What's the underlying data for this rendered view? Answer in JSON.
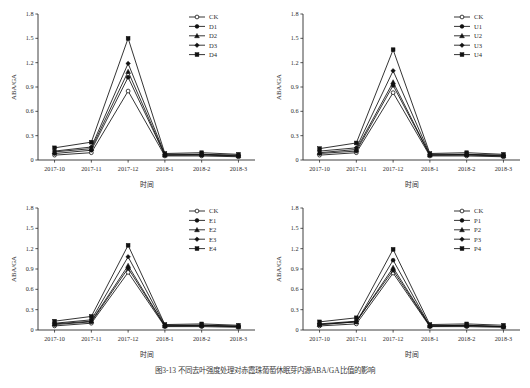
{
  "figure": {
    "caption": "图3-13  不同去叶强度处理对赤霞珠葡萄休眠芽内源ABA/GA比值的影响",
    "panel_count": 4
  },
  "axis": {
    "x_label": "时间",
    "y_label": "ABA/GA",
    "x_ticks": [
      "2017-10",
      "2017-11",
      "2017-12",
      "2018-1",
      "2018-2",
      "2018-3"
    ],
    "y_ticks": [
      "0",
      "0.3",
      "0.6",
      "0.9",
      "1.2",
      "1.5",
      "1.8"
    ]
  },
  "markers": {
    "ck": "open-circle",
    "s1": "filled-circle",
    "s2": "filled-triangle",
    "s3": "filled-diamond",
    "s4": "filled-square"
  },
  "chart_data": [
    {
      "type": "line",
      "panel": "top-left",
      "title": "",
      "xlabel": "时间",
      "ylabel": "ABA/GA",
      "categories": [
        "2017-10",
        "2017-11",
        "2017-12",
        "2018-1",
        "2018-2",
        "2018-3"
      ],
      "ylim": [
        0,
        1.8
      ],
      "xlim_labels": [
        "2017-10",
        "2018-3"
      ],
      "grid": false,
      "legend_position": "top-right",
      "series": [
        {
          "name": "CK",
          "marker": "open-circle",
          "values": [
            0.06,
            0.09,
            0.85,
            0.05,
            0.05,
            0.04
          ]
        },
        {
          "name": "D1",
          "marker": "filled-circle",
          "values": [
            0.08,
            0.12,
            1.02,
            0.06,
            0.06,
            0.05
          ]
        },
        {
          "name": "D2",
          "marker": "filled-triangle",
          "values": [
            0.1,
            0.14,
            1.09,
            0.06,
            0.07,
            0.05
          ]
        },
        {
          "name": "D3",
          "marker": "filled-diamond",
          "values": [
            0.11,
            0.16,
            1.19,
            0.07,
            0.07,
            0.06
          ]
        },
        {
          "name": "D4",
          "marker": "filled-square",
          "values": [
            0.15,
            0.22,
            1.5,
            0.08,
            0.09,
            0.07
          ]
        }
      ]
    },
    {
      "type": "line",
      "panel": "top-right",
      "title": "",
      "xlabel": "时间",
      "ylabel": "ABA/GA",
      "categories": [
        "2017-10",
        "2017-11",
        "2017-12",
        "2018-1",
        "2018-2",
        "2018-3"
      ],
      "ylim": [
        0,
        1.8
      ],
      "grid": false,
      "legend_position": "top-right",
      "series": [
        {
          "name": "CK",
          "marker": "open-circle",
          "values": [
            0.06,
            0.09,
            0.83,
            0.05,
            0.05,
            0.04
          ]
        },
        {
          "name": "U1",
          "marker": "filled-circle",
          "values": [
            0.08,
            0.11,
            0.92,
            0.06,
            0.06,
            0.05
          ]
        },
        {
          "name": "U2",
          "marker": "filled-triangle",
          "values": [
            0.09,
            0.13,
            0.96,
            0.06,
            0.07,
            0.05
          ]
        },
        {
          "name": "U3",
          "marker": "filled-diamond",
          "values": [
            0.11,
            0.15,
            1.1,
            0.07,
            0.07,
            0.06
          ]
        },
        {
          "name": "U4",
          "marker": "filled-square",
          "values": [
            0.14,
            0.21,
            1.36,
            0.08,
            0.09,
            0.07
          ]
        }
      ]
    },
    {
      "type": "line",
      "panel": "bottom-left",
      "title": "",
      "xlabel": "时间",
      "ylabel": "ABA/GA",
      "categories": [
        "2017-10",
        "2017-11",
        "2017-12",
        "2018-1",
        "2018-2",
        "2018-3"
      ],
      "ylim": [
        0,
        1.8
      ],
      "grid": false,
      "legend_position": "top-right",
      "series": [
        {
          "name": "CK",
          "marker": "open-circle",
          "values": [
            0.06,
            0.1,
            0.85,
            0.05,
            0.05,
            0.04
          ]
        },
        {
          "name": "E1",
          "marker": "filled-circle",
          "values": [
            0.08,
            0.12,
            0.91,
            0.06,
            0.06,
            0.05
          ]
        },
        {
          "name": "E2",
          "marker": "filled-triangle",
          "values": [
            0.09,
            0.13,
            0.95,
            0.06,
            0.07,
            0.05
          ]
        },
        {
          "name": "E3",
          "marker": "filled-diamond",
          "values": [
            0.1,
            0.15,
            1.08,
            0.07,
            0.07,
            0.06
          ]
        },
        {
          "name": "E4",
          "marker": "filled-square",
          "values": [
            0.13,
            0.2,
            1.25,
            0.08,
            0.09,
            0.07
          ]
        }
      ]
    },
    {
      "type": "line",
      "panel": "bottom-right",
      "title": "",
      "xlabel": "时间",
      "ylabel": "ABA/GA",
      "categories": [
        "2017-10",
        "2017-11",
        "2017-12",
        "2018-1",
        "2018-2",
        "2018-3"
      ],
      "ylim": [
        0,
        1.8
      ],
      "grid": false,
      "legend_position": "top-right",
      "series": [
        {
          "name": "CK",
          "marker": "open-circle",
          "values": [
            0.06,
            0.09,
            0.84,
            0.05,
            0.05,
            0.04
          ]
        },
        {
          "name": "P1",
          "marker": "filled-circle",
          "values": [
            0.08,
            0.12,
            1.03,
            0.06,
            0.06,
            0.05
          ]
        },
        {
          "name": "P2",
          "marker": "filled-triangle",
          "values": [
            0.08,
            0.12,
            0.92,
            0.06,
            0.07,
            0.05
          ]
        },
        {
          "name": "P3",
          "marker": "filled-diamond",
          "values": [
            0.09,
            0.13,
            0.88,
            0.06,
            0.07,
            0.05
          ]
        },
        {
          "name": "P4",
          "marker": "filled-square",
          "values": [
            0.12,
            0.18,
            1.19,
            0.08,
            0.09,
            0.07
          ]
        }
      ]
    }
  ]
}
